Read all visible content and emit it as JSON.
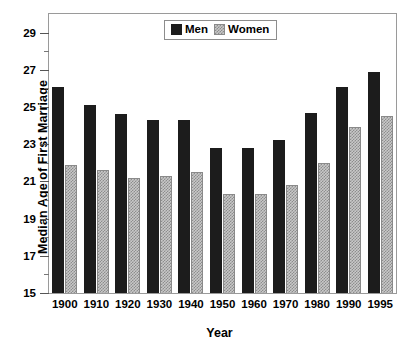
{
  "chart_data": {
    "type": "bar",
    "title": "",
    "xlabel": "Year",
    "ylabel": "Median Age of First Marriage",
    "categories": [
      "1900",
      "1910",
      "1920",
      "1930",
      "1940",
      "1950",
      "1960",
      "1970",
      "1980",
      "1990",
      "1995"
    ],
    "series": [
      {
        "name": "Men",
        "color": "#1c1c1c",
        "values": [
          26.1,
          25.1,
          24.6,
          24.3,
          24.3,
          22.8,
          22.8,
          23.2,
          24.7,
          26.1,
          26.9
        ]
      },
      {
        "name": "Women",
        "color": "#c8c8c8",
        "values": [
          21.9,
          21.6,
          21.2,
          21.3,
          21.5,
          20.3,
          20.3,
          20.8,
          22.0,
          23.9,
          24.5
        ]
      }
    ],
    "ylim": [
      15,
      30
    ],
    "ytick_labels": [
      "15",
      "17",
      "19",
      "21",
      "23",
      "25",
      "27",
      "29"
    ],
    "ytick_values": [
      15,
      17,
      19,
      21,
      23,
      25,
      27,
      29
    ],
    "ytick_minor_values": [
      16,
      18,
      20,
      22,
      24,
      26,
      28
    ],
    "grid": false,
    "legend_position": "top-center",
    "legend_entries": [
      "Men",
      "Women"
    ]
  }
}
